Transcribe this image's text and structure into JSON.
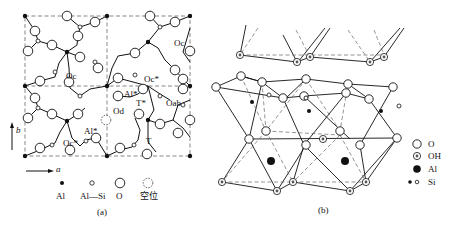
{
  "panel_a": {
    "caption": "(a)",
    "axis_a": "a",
    "axis_b": "b",
    "site_labels": {
      "oc_top_right": "Oc",
      "oc_left": "Oc",
      "oc_star_mid": "Oc*",
      "al_star_mid": "Al*",
      "t_star": "T*",
      "oab": "Oab",
      "od": "Od",
      "al_star_low": "Al*",
      "oc_star_low": "Oc*",
      "t": "T"
    },
    "legend": [
      {
        "symbol": "filled-small-dot",
        "label": "Al"
      },
      {
        "symbol": "small-open-circle",
        "label": "Al—Si"
      },
      {
        "symbol": "large-open-circle",
        "label": "O"
      },
      {
        "symbol": "dashed-circle",
        "label": "空位"
      }
    ]
  },
  "panel_b": {
    "caption": "(b)",
    "oh_marker": "OH",
    "legend": [
      {
        "symbol": "large-open-circle",
        "label": "O"
      },
      {
        "symbol": "oh-circle",
        "label": "OH"
      },
      {
        "symbol": "large-filled-dot",
        "label": "Al"
      },
      {
        "symbol": "filled-and-open-small-dots",
        "label": "Si"
      }
    ]
  }
}
